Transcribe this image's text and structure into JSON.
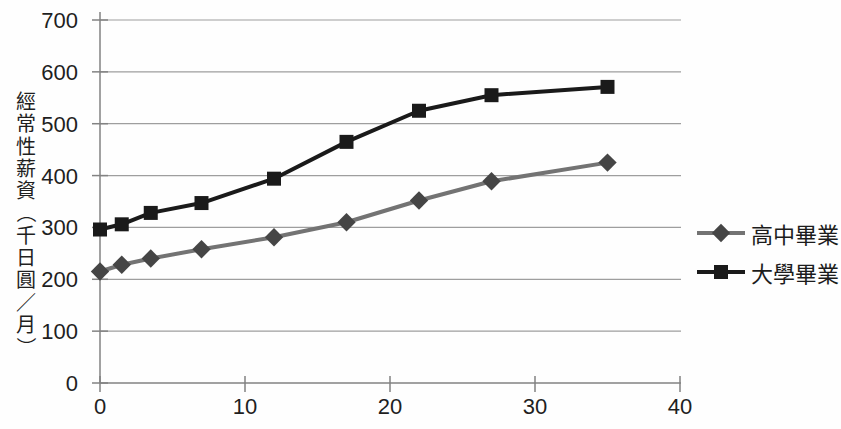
{
  "chart_data": {
    "type": "line",
    "title": "",
    "y_axis_title": "經常性薪資（千日圓／月）",
    "x_label": "",
    "xlim": [
      0,
      40
    ],
    "ylim": [
      0,
      700
    ],
    "x_ticks": [
      0,
      10,
      20,
      30,
      40
    ],
    "y_ticks": [
      0,
      100,
      200,
      300,
      400,
      500,
      600,
      700
    ],
    "grid": "horizontal-gridlines-on",
    "legend_position": "right",
    "series": [
      {
        "name": "高中畢業",
        "marker": "diamond",
        "line_color": "#737373",
        "marker_color": "#454545",
        "x": [
          0,
          1.5,
          3.5,
          7,
          12,
          17,
          22,
          27,
          35
        ],
        "values": [
          215,
          228,
          240,
          258,
          281,
          310,
          352,
          389,
          425
        ]
      },
      {
        "name": "大學畢業",
        "marker": "square",
        "line_color": "#1a1a1a",
        "marker_color": "#1a1a1a",
        "x": [
          0,
          1.5,
          3.5,
          7,
          12,
          17,
          22,
          27,
          35
        ],
        "values": [
          296,
          306,
          328,
          347,
          394,
          465,
          525,
          555,
          571
        ]
      }
    ],
    "colors": {
      "gridline": "#9e9e9e",
      "axis": "#828282",
      "tick_label": "#1f1f1f",
      "background": "#fefefe"
    }
  }
}
